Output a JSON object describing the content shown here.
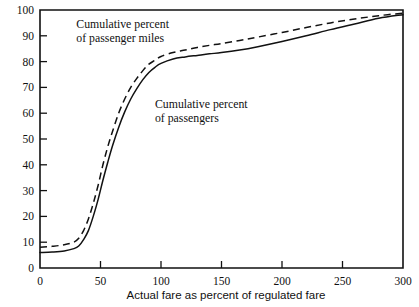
{
  "chart_data": {
    "type": "line",
    "title": "",
    "xlabel": "Actual fare as percent of regulated fare",
    "ylabel": "",
    "xlim": [
      0,
      300
    ],
    "ylim": [
      0,
      100
    ],
    "grid": false,
    "legend_position": "inline-annotations",
    "xticks": [
      0,
      50,
      100,
      150,
      200,
      250,
      300
    ],
    "xticklabels": [
      "0",
      "50",
      "100",
      "150",
      "200",
      "250",
      "300"
    ],
    "yticks": [
      0,
      10,
      20,
      30,
      40,
      50,
      60,
      70,
      80,
      90,
      100
    ],
    "yticklabels": [
      "0",
      "10",
      "20",
      "30",
      "40",
      "50",
      "60",
      "70",
      "80",
      "90",
      "100"
    ],
    "annotations": [
      {
        "text_line1": "Cumulative percent",
        "text_line2": "of passenger miles",
        "x": 30,
        "y": 93
      },
      {
        "text_line1": "Cumulative percent",
        "text_line2": "of passengers",
        "x": 95,
        "y": 62
      }
    ],
    "series": [
      {
        "name": "Cumulative percent of passenger miles",
        "style": "dashed",
        "color": "#111111",
        "x": [
          0,
          10,
          20,
          28,
          32,
          36,
          40,
          44,
          48,
          52,
          56,
          60,
          65,
          70,
          75,
          80,
          85,
          90,
          95,
          100,
          110,
          120,
          130,
          140,
          150,
          165,
          180,
          200,
          220,
          240,
          260,
          280,
          300
        ],
        "y": [
          8,
          8.4,
          9,
          10,
          11.5,
          14.5,
          19,
          25,
          32,
          40,
          47,
          53,
          60,
          65.5,
          70,
          73.5,
          76.5,
          79,
          80.5,
          82,
          83.5,
          84.5,
          85.5,
          86.3,
          87,
          88.2,
          89.5,
          91.3,
          93.2,
          95,
          96.5,
          97.8,
          98.8
        ]
      },
      {
        "name": "Cumulative percent of passengers",
        "style": "solid",
        "color": "#111111",
        "x": [
          0,
          10,
          20,
          28,
          32,
          36,
          40,
          44,
          48,
          52,
          56,
          60,
          65,
          70,
          75,
          80,
          85,
          90,
          95,
          100,
          110,
          120,
          130,
          140,
          150,
          165,
          180,
          200,
          220,
          240,
          260,
          280,
          300
        ],
        "y": [
          6,
          6.2,
          6.6,
          7.5,
          8.5,
          11,
          14.5,
          20,
          26.5,
          34,
          41,
          47.5,
          54.5,
          60.5,
          65.5,
          69.5,
          73,
          75.8,
          77.8,
          79.3,
          81,
          81.8,
          82.4,
          83,
          83.5,
          84.5,
          85.8,
          87.8,
          90,
          92.4,
          94.6,
          96.8,
          98.2
        ]
      }
    ]
  }
}
